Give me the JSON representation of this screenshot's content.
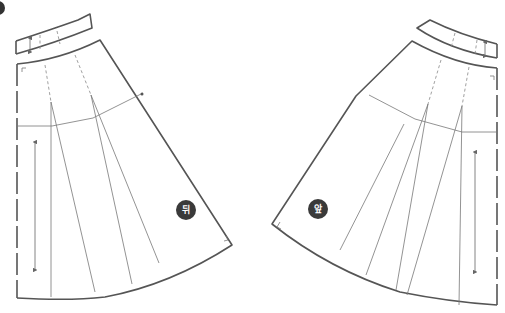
{
  "figure": {
    "type": "sewing-pattern",
    "pieces": [
      {
        "id": "back",
        "label": "뒤",
        "meaning": "back skirt piece"
      },
      {
        "id": "front",
        "label": "앞",
        "meaning": "front skirt piece"
      }
    ],
    "colors": {
      "outline": "#555555",
      "badge": "#3a3a3a",
      "badge_text": "#ffffff"
    }
  }
}
